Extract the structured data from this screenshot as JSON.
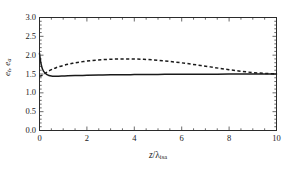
{
  "chart_data": {
    "type": "line",
    "title": "",
    "xlabel": "z/λ_isa",
    "ylabel": "e_t , e_a",
    "xlim": [
      0,
      10
    ],
    "ylim": [
      0.0,
      3.0
    ],
    "grid": false,
    "legend": "none",
    "xticks": [
      "0",
      "2",
      "4",
      "6",
      "8",
      "10"
    ],
    "xtick_values": [
      0,
      2,
      4,
      6,
      8,
      10
    ],
    "xminor_step": 0.5,
    "yticks": [
      "0.0",
      "0.5",
      "1.0",
      "1.5",
      "2.0",
      "2.5",
      "3.0"
    ],
    "ytick_values": [
      0.0,
      0.5,
      1.0,
      1.5,
      2.0,
      2.5,
      3.0
    ],
    "yminor_step": 0.1,
    "series": [
      {
        "name": "e_t",
        "style": "solid",
        "color": "#1a1a1a",
        "x": [
          0.0,
          0.05,
          0.1,
          0.15,
          0.2,
          0.3,
          0.4,
          0.5,
          0.6,
          0.8,
          1.0,
          1.2,
          1.5,
          2.0,
          2.5,
          3.0,
          3.5,
          4.0,
          4.5,
          5.0,
          5.5,
          6.0,
          6.5,
          7.0,
          7.5,
          8.0,
          8.5,
          9.0,
          9.5,
          10.0
        ],
        "y": [
          2.05,
          1.82,
          1.68,
          1.6,
          1.55,
          1.49,
          1.46,
          1.445,
          1.44,
          1.442,
          1.447,
          1.452,
          1.458,
          1.466,
          1.472,
          1.477,
          1.481,
          1.484,
          1.487,
          1.489,
          1.491,
          1.493,
          1.494,
          1.495,
          1.496,
          1.497,
          1.498,
          1.499,
          1.499,
          1.5
        ]
      },
      {
        "name": "e_a",
        "style": "dashed",
        "color": "#1a1a1a",
        "x": [
          0.0,
          0.1,
          0.2,
          0.3,
          0.5,
          0.7,
          1.0,
          1.3,
          1.6,
          2.0,
          2.4,
          2.8,
          3.2,
          3.6,
          4.0,
          4.4,
          4.8,
          5.2,
          5.6,
          6.0,
          6.4,
          6.8,
          7.2,
          7.6,
          8.0,
          8.4,
          8.8,
          9.2,
          9.6,
          10.0
        ],
        "y": [
          1.44,
          1.46,
          1.5,
          1.545,
          1.615,
          1.668,
          1.726,
          1.77,
          1.806,
          1.842,
          1.868,
          1.885,
          1.896,
          1.9,
          1.898,
          1.889,
          1.874,
          1.853,
          1.827,
          1.796,
          1.762,
          1.726,
          1.689,
          1.651,
          1.614,
          1.58,
          1.551,
          1.528,
          1.512,
          1.503
        ]
      }
    ]
  },
  "axes": {
    "ylabel_main": "e",
    "ylabel_sub1": "t",
    "ylabel_comma": ", ",
    "ylabel_main2": "e",
    "ylabel_sub2": "a",
    "xlabel_z": "z",
    "xlabel_slash": "/",
    "xlabel_lambda": "λ",
    "xlabel_sub": "isa"
  }
}
